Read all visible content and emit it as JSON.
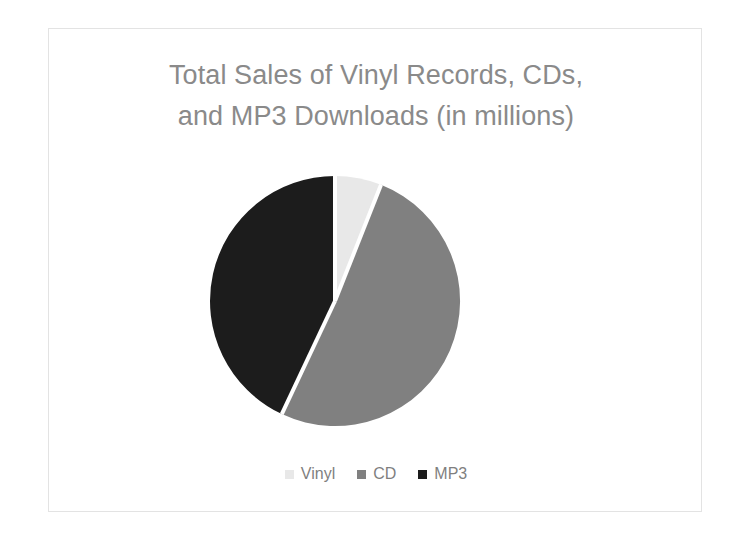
{
  "chart_data": {
    "type": "pie",
    "title_line1": "Total Sales of Vinyl Records, CDs,",
    "title_line2": "and MP3 Downloads (in millions)",
    "xlabel": "",
    "ylabel": "",
    "legend_position": "bottom",
    "grid": false,
    "start_angle_deg": 0,
    "direction": "clockwise",
    "categories": [
      "Vinyl",
      "CD",
      "MP3"
    ],
    "values": [
      6,
      51,
      43
    ],
    "units": "millions",
    "slices": [
      {
        "label": "Vinyl",
        "value": 6,
        "percent": 6,
        "color": "#e8e8e8",
        "start_angle_deg": 0,
        "end_angle_deg": 21.6
      },
      {
        "label": "CD",
        "value": 51,
        "percent": 51,
        "color": "#808080",
        "start_angle_deg": 21.6,
        "end_angle_deg": 205.2
      },
      {
        "label": "MP3",
        "value": 43,
        "percent": 43,
        "color": "#1c1c1c",
        "start_angle_deg": 205.2,
        "end_angle_deg": 360
      }
    ]
  },
  "legend": {
    "items": [
      {
        "label": "Vinyl",
        "color": "#e8e8e8",
        "marker": "square-swatch-icon"
      },
      {
        "label": "CD",
        "color": "#808080",
        "marker": "square-swatch-icon"
      },
      {
        "label": "MP3",
        "color": "#1c1c1c",
        "marker": "square-swatch-icon"
      }
    ]
  },
  "style": {
    "background": "#ffffff",
    "frame_border": "#e3e3e3",
    "title_color": "#8a8a8a",
    "legend_text_color": "#7f7f7f",
    "slice_separator": "#ffffff"
  }
}
